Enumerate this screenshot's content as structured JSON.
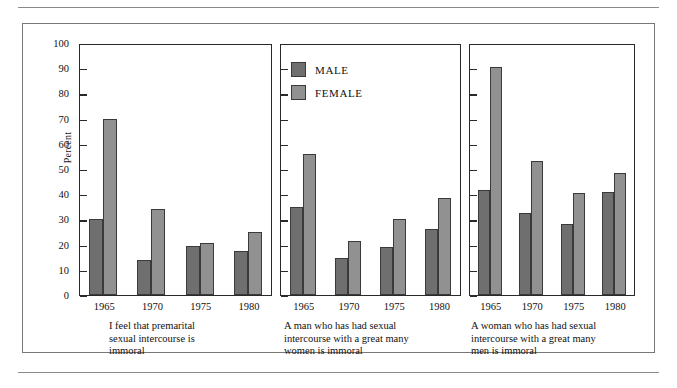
{
  "figure": {
    "ylabel": "Percent",
    "ytick_labels": [
      "100",
      "90",
      "80",
      "70",
      "60",
      "50",
      "40",
      "30",
      "20",
      "10",
      "0"
    ],
    "legend": {
      "male_label": "MALE",
      "female_label": "FEMALE",
      "male_color": "#6f6f6f",
      "female_color": "#919191"
    },
    "xlabels": [
      "1965",
      "1970",
      "1975",
      "1980"
    ],
    "captions": {
      "panel1_line1": "I feel that premarital",
      "panel1_line2": "sexual intercourse is",
      "panel1_line3": "immoral",
      "panel2_line1": "A man who has had sexual",
      "panel2_line2": "intercourse with a great many",
      "panel2_line3": "women is immoral",
      "panel3_line1": "A woman who has had sexual",
      "panel3_line2": "intercourse with a great many",
      "panel3_line3": "men is immoral"
    }
  },
  "chart_data": {
    "type": "bar",
    "title": "",
    "xlabel": "",
    "ylabel": "Percent",
    "ylim": [
      0,
      100
    ],
    "ytick_step": 10,
    "grid": false,
    "legend_position": "top-center-panel2",
    "categories": [
      "1965",
      "1970",
      "1975",
      "1980"
    ],
    "panels": [
      {
        "caption": "I feel that premarital sexual intercourse is immoral",
        "series": [
          {
            "name": "MALE",
            "values": [
              30,
              14,
              19.5,
              17.5
            ]
          },
          {
            "name": "FEMALE",
            "values": [
              70,
              34,
              20.5,
              25
            ]
          }
        ]
      },
      {
        "caption": "A man who has had sexual intercourse with a great many women is immoral",
        "series": [
          {
            "name": "MALE",
            "values": [
              35,
              14.5,
              19,
              26
            ]
          },
          {
            "name": "FEMALE",
            "values": [
              56,
              21.5,
              30,
              38.5
            ]
          }
        ]
      },
      {
        "caption": "A woman who has had sexual intercourse with a great many men is immoral",
        "series": [
          {
            "name": "MALE",
            "values": [
              41.5,
              32.5,
              28,
              41
            ]
          },
          {
            "name": "FEMALE",
            "values": [
              90.5,
              53,
              40.5,
              48.5
            ]
          }
        ]
      }
    ]
  }
}
